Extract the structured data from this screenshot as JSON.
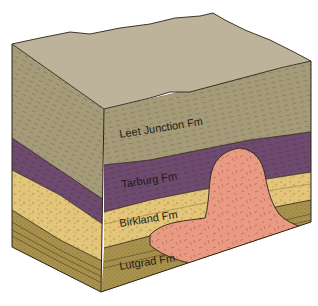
{
  "diagram": {
    "type": "geologic-block-diagram",
    "colors": {
      "top_surface": "#bdb39b",
      "leet_junction": "#a59b78",
      "tarburg": "#6e4a6e",
      "birkland": "#e3c67a",
      "lutgrad": "#a8924e",
      "intrusion": "#e89a82",
      "outline": "#2b2418"
    },
    "formations": [
      {
        "id": "leet-junction",
        "label": "Leet Junction Fm",
        "order": 1
      },
      {
        "id": "tarburg",
        "label": "Tarburg Fm",
        "order": 2
      },
      {
        "id": "birkland",
        "label": "Birkland Fm",
        "order": 3
      },
      {
        "id": "lutgrad",
        "label": "Lutgrad Fm",
        "order": 4
      }
    ],
    "intrusion": {
      "label": ""
    }
  }
}
